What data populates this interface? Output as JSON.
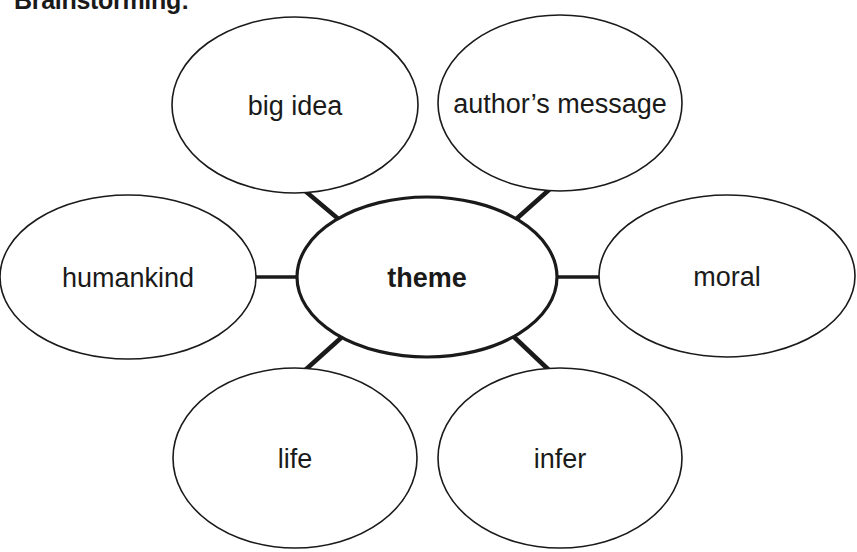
{
  "document": {
    "title": "Brainstorming:",
    "type": "word-web-diagram",
    "background_color": "#ffffff",
    "ink_color": "#1a1a1a"
  },
  "diagram": {
    "center_node": {
      "label": "theme",
      "cx": 427,
      "cy": 277,
      "rx": 130,
      "ry": 80,
      "stroke_width": 3.2,
      "bold": true
    },
    "satellite_nodes": [
      {
        "label": "big idea",
        "position": "top-left",
        "cx": 295,
        "cy": 105,
        "rx": 123,
        "ry": 88,
        "stroke_width": 1.6
      },
      {
        "label": "author’s message",
        "position": "top-right",
        "cx": 560,
        "cy": 103,
        "rx": 122,
        "ry": 88,
        "stroke_width": 1.6
      },
      {
        "label": "humankind",
        "position": "left",
        "cx": 128,
        "cy": 277,
        "rx": 128,
        "ry": 82,
        "stroke_width": 1.6
      },
      {
        "label": "moral",
        "position": "right",
        "cx": 727,
        "cy": 276,
        "rx": 128,
        "ry": 81,
        "stroke_width": 1.6
      },
      {
        "label": "life",
        "position": "bottom-left",
        "cx": 295,
        "cy": 458,
        "rx": 122,
        "ry": 90,
        "stroke_width": 1.6
      },
      {
        "label": "infer",
        "position": "bottom-right",
        "cx": 560,
        "cy": 458,
        "rx": 122,
        "ry": 90,
        "stroke_width": 1.6
      }
    ],
    "connectors": [
      {
        "from": "big idea",
        "to": "theme",
        "x1": 304,
        "y1": 190,
        "x2": 342,
        "y2": 222,
        "stroke_width": 4.5
      },
      {
        "from": "author’s message",
        "to": "theme",
        "x1": 550,
        "y1": 189,
        "x2": 514,
        "y2": 221,
        "stroke_width": 4.5
      },
      {
        "from": "humankind",
        "to": "theme",
        "x1": 256,
        "y1": 277,
        "x2": 298,
        "y2": 277,
        "stroke_width": 3.4
      },
      {
        "from": "moral",
        "to": "theme",
        "x1": 556,
        "y1": 277,
        "x2": 600,
        "y2": 277,
        "stroke_width": 3.4
      },
      {
        "from": "life",
        "to": "theme",
        "x1": 303,
        "y1": 372,
        "x2": 342,
        "y2": 337,
        "stroke_width": 4.5
      },
      {
        "from": "infer",
        "to": "theme",
        "x1": 551,
        "y1": 372,
        "x2": 513,
        "y2": 336,
        "stroke_width": 4.5
      }
    ]
  }
}
